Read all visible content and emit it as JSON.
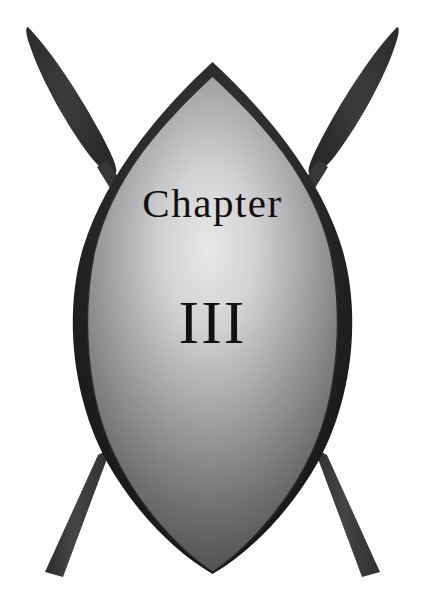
{
  "emblem": {
    "title_label": "Chapter",
    "number_label": "III",
    "number_value": 3,
    "background_color": "#ffffff",
    "text_color": "#111111",
    "shield_dark_color": "#1a1a1a",
    "shield_light_color": "#d8d8d8",
    "shield_mid_color": "#6f6f6f",
    "shield_edge_color": "#3a3a3a",
    "spear_color": "#3d3d3d",
    "spear_blade_color": "#333333",
    "parts": [
      {
        "name": "spear-left",
        "label": "Crossed spear (left)"
      },
      {
        "name": "spear-right",
        "label": "Crossed spear (right)"
      },
      {
        "name": "shield-outer",
        "label": "Outer almond shield"
      },
      {
        "name": "shield-inner",
        "label": "Inner shield face"
      }
    ]
  }
}
